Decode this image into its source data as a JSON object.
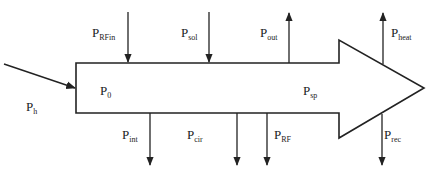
{
  "diagram": {
    "type": "power-flow-arrow",
    "stroke_color": "#222222",
    "background": "#ffffff",
    "labels": {
      "p_h": {
        "base": "P",
        "sub": "h"
      },
      "p_0": {
        "base": "P",
        "sub": "0"
      },
      "p_sp": {
        "base": "P",
        "sub": "sp"
      },
      "p_rfin": {
        "base": "P",
        "sub": "RFin"
      },
      "p_sol": {
        "base": "P",
        "sub": "sol"
      },
      "p_out": {
        "base": "P",
        "sub": "out"
      },
      "p_heat": {
        "base": "P",
        "sub": "heat"
      },
      "p_int": {
        "base": "P",
        "sub": "int"
      },
      "p_cir": {
        "base": "P",
        "sub": "cir"
      },
      "p_rf": {
        "base": "P",
        "sub": "RF"
      },
      "p_rec": {
        "base": "P",
        "sub": "rec"
      }
    },
    "flows": [
      {
        "id": "p_h",
        "direction": "in-left"
      },
      {
        "id": "p_rfin",
        "direction": "in-top"
      },
      {
        "id": "p_sol",
        "direction": "in-top"
      },
      {
        "id": "p_out",
        "direction": "out-top"
      },
      {
        "id": "p_heat",
        "direction": "out-top"
      },
      {
        "id": "p_int",
        "direction": "out-bottom"
      },
      {
        "id": "p_cir",
        "direction": "out-bottom"
      },
      {
        "id": "p_rf",
        "direction": "out-bottom"
      },
      {
        "id": "p_rec",
        "direction": "out-bottom"
      }
    ]
  }
}
